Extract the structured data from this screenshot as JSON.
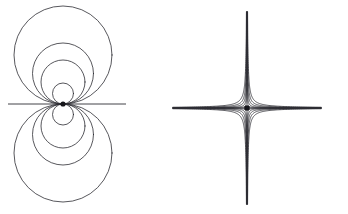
{
  "document": {
    "title": "Field Line Diagrams",
    "background_color": "#ffffff",
    "width": 348,
    "height": 214
  },
  "style": {
    "curve_color": "#2d2d33",
    "axis_color": "#2d2d33",
    "point_color": "#15151a",
    "curve_stroke_width": 0.8,
    "axis_stroke_width": 0.9
  },
  "figures": [
    {
      "id": "dipole-figure",
      "name": "dipole-field-diagram",
      "label": "",
      "type": "dipole",
      "center": {
        "x": 63,
        "y": 104
      },
      "singular_point_radius": 2.6,
      "axis": {
        "x1": 8,
        "x2": 126,
        "y": 104
      },
      "upper_circle_radii": [
        10.5,
        22,
        30.5,
        49
      ],
      "lower_circle_radii": [
        10.5,
        22,
        30.5,
        49
      ],
      "circle_count_upper": 4,
      "circle_count_lower": 4
    },
    {
      "id": "saddle-figure",
      "name": "saddle-field-diagram",
      "label": "",
      "type": "saddle",
      "center": {
        "x": 247,
        "y": 108
      },
      "singular_point_radius": 2.8,
      "axis": {
        "x1": 178,
        "x2": 318,
        "y": 108
      },
      "hyperbola_constants": [
        3.2,
        9.0,
        19.0,
        34.0,
        56.0
      ],
      "branch_count_per_quadrant": 5,
      "extent": {
        "x_half": 74,
        "y_half": 96
      },
      "asymptote_clearance": 2.0
    }
  ]
}
